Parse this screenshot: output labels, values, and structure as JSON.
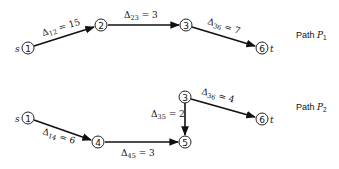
{
  "paths": [
    {
      "id": "P1",
      "label_prefix": "Path ",
      "label_name": "P",
      "label_sub": "1",
      "source_label": "s",
      "sink_label": "t",
      "nodes": [
        {
          "id": "1",
          "label": "1"
        },
        {
          "id": "2",
          "label": "2"
        },
        {
          "id": "3",
          "label": "3"
        },
        {
          "id": "6",
          "label": "6"
        }
      ],
      "edges": [
        {
          "from": "1",
          "to": "2",
          "symbol": "Δ",
          "sub": "12",
          "value": " = 15"
        },
        {
          "from": "2",
          "to": "3",
          "symbol": "Δ",
          "sub": "23",
          "value": " = 3"
        },
        {
          "from": "3",
          "to": "6",
          "symbol": "Δ",
          "sub": "36",
          "value": " = 7"
        }
      ]
    },
    {
      "id": "P2",
      "label_prefix": "Path ",
      "label_name": "P",
      "label_sub": "2",
      "source_label": "s",
      "sink_label": "t",
      "nodes": [
        {
          "id": "1",
          "label": "1"
        },
        {
          "id": "4",
          "label": "4"
        },
        {
          "id": "5",
          "label": "5"
        },
        {
          "id": "3",
          "label": "3"
        },
        {
          "id": "6",
          "label": "6"
        }
      ],
      "edges": [
        {
          "from": "1",
          "to": "4",
          "symbol": "Δ",
          "sub": "14",
          "value": " = 6"
        },
        {
          "from": "4",
          "to": "5",
          "symbol": "Δ",
          "sub": "45",
          "value": " = 3"
        },
        {
          "from": "3",
          "to": "5",
          "symbol": "Δ",
          "sub": "35",
          "value": " = 2"
        },
        {
          "from": "3",
          "to": "6",
          "symbol": "Δ",
          "sub": "36",
          "value": " = 4"
        }
      ]
    }
  ]
}
